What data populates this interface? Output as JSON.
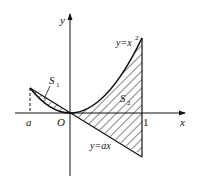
{
  "diagram": {
    "axes": {
      "x_label": "x",
      "y_label": "y",
      "origin_label": "O"
    },
    "ticks": {
      "a_label": "a",
      "one_label": "1"
    },
    "curves": {
      "parabola_label_main": "y=x",
      "parabola_label_exp": "2",
      "line_label": "y=ax"
    },
    "regions": {
      "s1_main": "S",
      "s1_sub": "1",
      "s2_main": "S",
      "s2_sub": "2"
    },
    "colors": {
      "ink": "#111111",
      "background": "#ffffff"
    }
  }
}
